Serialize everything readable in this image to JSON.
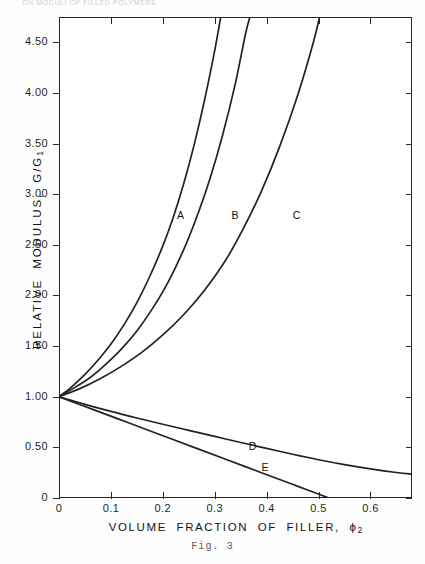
{
  "page": {
    "running_head": "ON MODULI OF FILLED POLYMERS",
    "folio": "",
    "caption": "Fig. 3"
  },
  "chart_data": {
    "type": "line",
    "title": "",
    "xlabel": "VOLUME FRACTION OF FILLER, ϕ₂",
    "ylabel": "RELATIVE MODULUS, G/G₁",
    "xlim": [
      0,
      0.68
    ],
    "ylim": [
      0,
      4.75
    ],
    "grid": false,
    "legend_position": "inline-curve-labels",
    "xticks": [
      0,
      0.1,
      0.2,
      0.3,
      0.4,
      0.5,
      0.6
    ],
    "xticklabels": [
      "0",
      "0.1",
      "0.2",
      "0.3",
      "0.4",
      "0.5",
      "0.6"
    ],
    "yticks": [
      0,
      0.5,
      1.0,
      1.5,
      2.0,
      2.5,
      3.0,
      3.5,
      4.0,
      4.5
    ],
    "yticklabels": [
      "0",
      "0.50",
      "1.00",
      "1.50",
      "2.00",
      "2.50",
      "3.00",
      "3.50",
      "4.00",
      "4.50"
    ],
    "series": [
      {
        "name": "A",
        "label": "A",
        "label_x": 0.235,
        "label_y": 2.78,
        "color": "#222222",
        "points": [
          [
            0.0,
            1.0
          ],
          [
            0.025,
            1.1
          ],
          [
            0.05,
            1.22
          ],
          [
            0.075,
            1.36
          ],
          [
            0.1,
            1.52
          ],
          [
            0.125,
            1.71
          ],
          [
            0.15,
            1.93
          ],
          [
            0.175,
            2.19
          ],
          [
            0.2,
            2.49
          ],
          [
            0.22,
            2.77
          ],
          [
            0.24,
            3.1
          ],
          [
            0.26,
            3.48
          ],
          [
            0.28,
            3.92
          ],
          [
            0.3,
            4.42
          ],
          [
            0.314,
            4.82
          ]
        ]
      },
      {
        "name": "B",
        "label": "B",
        "label_x": 0.34,
        "label_y": 2.78,
        "color": "#222222",
        "points": [
          [
            0.0,
            1.0
          ],
          [
            0.03,
            1.09
          ],
          [
            0.06,
            1.19
          ],
          [
            0.09,
            1.32
          ],
          [
            0.12,
            1.47
          ],
          [
            0.15,
            1.65
          ],
          [
            0.18,
            1.87
          ],
          [
            0.21,
            2.13
          ],
          [
            0.24,
            2.45
          ],
          [
            0.265,
            2.77
          ],
          [
            0.29,
            3.14
          ],
          [
            0.315,
            3.58
          ],
          [
            0.34,
            4.1
          ],
          [
            0.36,
            4.6
          ],
          [
            0.372,
            4.82
          ]
        ]
      },
      {
        "name": "C",
        "label": "C",
        "label_x": 0.458,
        "label_y": 2.78,
        "color": "#222222",
        "points": [
          [
            0.0,
            1.0
          ],
          [
            0.04,
            1.08
          ],
          [
            0.08,
            1.18
          ],
          [
            0.12,
            1.3
          ],
          [
            0.16,
            1.44
          ],
          [
            0.2,
            1.61
          ],
          [
            0.24,
            1.81
          ],
          [
            0.28,
            2.05
          ],
          [
            0.32,
            2.34
          ],
          [
            0.355,
            2.66
          ],
          [
            0.39,
            3.03
          ],
          [
            0.425,
            3.47
          ],
          [
            0.46,
            3.98
          ],
          [
            0.49,
            4.5
          ],
          [
            0.505,
            4.82
          ]
        ]
      },
      {
        "name": "D",
        "label": "D",
        "label_x": 0.373,
        "label_y": 0.5,
        "color": "#222222",
        "points": [
          [
            0.0,
            1.0
          ],
          [
            0.05,
            0.925
          ],
          [
            0.1,
            0.855
          ],
          [
            0.15,
            0.79
          ],
          [
            0.2,
            0.728
          ],
          [
            0.25,
            0.668
          ],
          [
            0.3,
            0.608
          ],
          [
            0.35,
            0.548
          ],
          [
            0.4,
            0.49
          ],
          [
            0.45,
            0.432
          ],
          [
            0.5,
            0.378
          ],
          [
            0.55,
            0.33
          ],
          [
            0.6,
            0.288
          ],
          [
            0.65,
            0.252
          ],
          [
            0.68,
            0.235
          ]
        ]
      },
      {
        "name": "E",
        "label": "E",
        "label_x": 0.398,
        "label_y": 0.295,
        "color": "#222222",
        "points": [
          [
            0.0,
            1.0
          ],
          [
            0.065,
            0.875
          ],
          [
            0.13,
            0.75
          ],
          [
            0.195,
            0.625
          ],
          [
            0.26,
            0.5
          ],
          [
            0.325,
            0.375
          ],
          [
            0.39,
            0.25
          ],
          [
            0.455,
            0.125
          ],
          [
            0.52,
            0.0
          ]
        ]
      }
    ]
  }
}
